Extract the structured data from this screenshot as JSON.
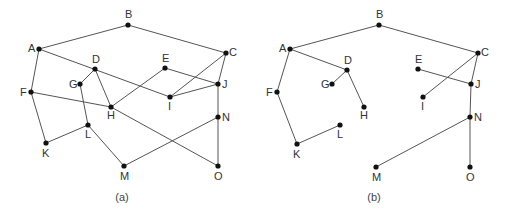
{
  "colors": {
    "edge": "#555555",
    "node": "#111111",
    "label": "#333333"
  },
  "graphs": [
    {
      "id": "a",
      "caption": "(a)",
      "caption_pos": [
        122,
        201
      ],
      "nodes": [
        {
          "id": "A",
          "x": 39,
          "y": 49,
          "lx": -11,
          "ly": 3
        },
        {
          "id": "B",
          "x": 128,
          "y": 25,
          "lx": -3,
          "ly": -7
        },
        {
          "id": "C",
          "x": 226,
          "y": 53,
          "lx": 3,
          "ly": 3
        },
        {
          "id": "D",
          "x": 95,
          "y": 69,
          "lx": -3,
          "ly": -6
        },
        {
          "id": "E",
          "x": 165,
          "y": 68,
          "lx": -3,
          "ly": -6
        },
        {
          "id": "F",
          "x": 31,
          "y": 92,
          "lx": -11,
          "ly": 4
        },
        {
          "id": "G",
          "x": 80,
          "y": 84,
          "lx": -11,
          "ly": 4
        },
        {
          "id": "H",
          "x": 111,
          "y": 107,
          "lx": -4,
          "ly": 12
        },
        {
          "id": "I",
          "x": 170,
          "y": 97,
          "lx": -2,
          "ly": 13
        },
        {
          "id": "J",
          "x": 218,
          "y": 84,
          "lx": 4,
          "ly": 4
        },
        {
          "id": "K",
          "x": 46,
          "y": 143,
          "lx": -4,
          "ly": 14
        },
        {
          "id": "L",
          "x": 88,
          "y": 125,
          "lx": -3,
          "ly": 13
        },
        {
          "id": "M",
          "x": 124,
          "y": 166,
          "lx": -4,
          "ly": 14
        },
        {
          "id": "N",
          "x": 218,
          "y": 117,
          "lx": 4,
          "ly": 4
        },
        {
          "id": "O",
          "x": 218,
          "y": 166,
          "lx": -4,
          "ly": 14
        }
      ],
      "edges": [
        [
          "A",
          "B"
        ],
        [
          "B",
          "C"
        ],
        [
          "A",
          "F"
        ],
        [
          "A",
          "I"
        ],
        [
          "D",
          "G"
        ],
        [
          "D",
          "H"
        ],
        [
          "F",
          "H"
        ],
        [
          "G",
          "L"
        ],
        [
          "F",
          "K"
        ],
        [
          "K",
          "L"
        ],
        [
          "L",
          "M"
        ],
        [
          "H",
          "E"
        ],
        [
          "H",
          "O"
        ],
        [
          "E",
          "J"
        ],
        [
          "I",
          "C"
        ],
        [
          "I",
          "J"
        ],
        [
          "C",
          "J"
        ],
        [
          "J",
          "N"
        ],
        [
          "N",
          "M"
        ],
        [
          "N",
          "O"
        ]
      ]
    },
    {
      "id": "b",
      "caption": "(b)",
      "caption_pos": [
        374,
        201
      ],
      "nodes": [
        {
          "id": "A",
          "x": 290,
          "y": 49,
          "lx": -11,
          "ly": 3
        },
        {
          "id": "B",
          "x": 379,
          "y": 25,
          "lx": -3,
          "ly": -7
        },
        {
          "id": "C",
          "x": 478,
          "y": 53,
          "lx": 3,
          "ly": 3
        },
        {
          "id": "D",
          "x": 347,
          "y": 70,
          "lx": -3,
          "ly": -6
        },
        {
          "id": "E",
          "x": 418,
          "y": 69,
          "lx": -3,
          "ly": -6
        },
        {
          "id": "F",
          "x": 277,
          "y": 92,
          "lx": -11,
          "ly": 4
        },
        {
          "id": "G",
          "x": 332,
          "y": 84,
          "lx": -11,
          "ly": 4
        },
        {
          "id": "H",
          "x": 364,
          "y": 107,
          "lx": -4,
          "ly": 12
        },
        {
          "id": "I",
          "x": 423,
          "y": 97,
          "lx": -2,
          "ly": 13
        },
        {
          "id": "J",
          "x": 471,
          "y": 84,
          "lx": 4,
          "ly": 4
        },
        {
          "id": "K",
          "x": 297,
          "y": 144,
          "lx": -4,
          "ly": 14
        },
        {
          "id": "L",
          "x": 340,
          "y": 125,
          "lx": -3,
          "ly": 13
        },
        {
          "id": "M",
          "x": 376,
          "y": 167,
          "lx": -4,
          "ly": 14
        },
        {
          "id": "N",
          "x": 470,
          "y": 117,
          "lx": 4,
          "ly": 4
        },
        {
          "id": "O",
          "x": 470,
          "y": 167,
          "lx": -4,
          "ly": 14
        }
      ],
      "edges": [
        [
          "A",
          "B"
        ],
        [
          "B",
          "C"
        ],
        [
          "A",
          "F"
        ],
        [
          "A",
          "D"
        ],
        [
          "D",
          "G"
        ],
        [
          "D",
          "H"
        ],
        [
          "F",
          "K"
        ],
        [
          "K",
          "L"
        ],
        [
          "C",
          "I"
        ],
        [
          "C",
          "J"
        ],
        [
          "E",
          "J"
        ],
        [
          "J",
          "N"
        ],
        [
          "N",
          "M"
        ],
        [
          "N",
          "O"
        ]
      ]
    }
  ]
}
